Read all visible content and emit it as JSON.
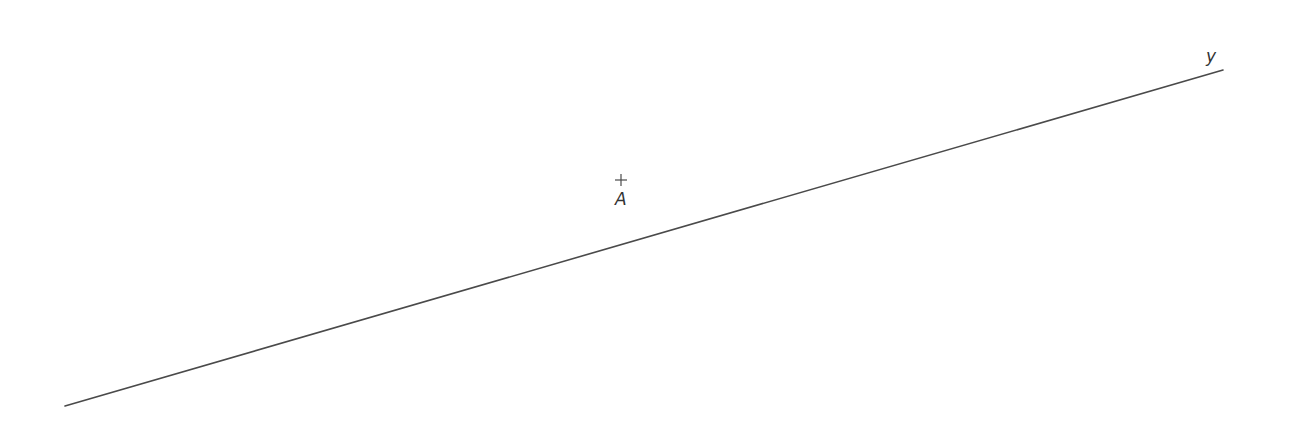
{
  "figure": {
    "background": "#ffffff",
    "stroke_color": "#4a4a4a",
    "line": {
      "label": "y",
      "x1": 65,
      "y1": 406,
      "x2": 1223,
      "y2": 70,
      "label_x": 1206,
      "label_y": 62
    },
    "point": {
      "label": "A",
      "x": 621,
      "y": 180,
      "label_x": 615,
      "label_y": 205
    }
  }
}
